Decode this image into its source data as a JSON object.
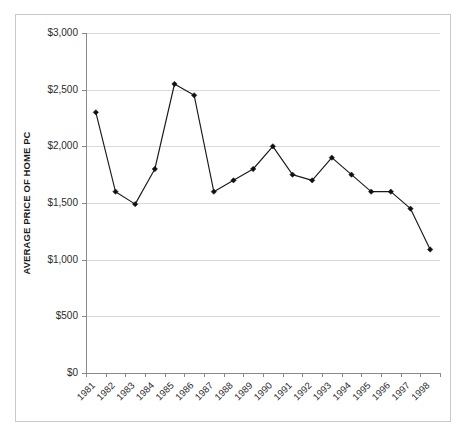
{
  "chart_data": {
    "type": "line",
    "title": "",
    "xlabel": "",
    "ylabel": "AVERAGE PRICE OF HOME PC",
    "ylim": [
      0,
      3000
    ],
    "ytick_values": [
      3000,
      2500,
      2000,
      1500,
      1000,
      500,
      0
    ],
    "ytick_labels": [
      "$3,000",
      "$2,500",
      "$2,000",
      "$1,500",
      "$1,000",
      "$500",
      "$0"
    ],
    "grid": true,
    "legend": null,
    "categories": [
      "1981",
      "1982",
      "1983",
      "1984",
      "1985",
      "1986",
      "1987",
      "1988",
      "1989",
      "1990",
      "1991",
      "1992",
      "1993",
      "1994",
      "1995",
      "1996",
      "1997",
      "1998"
    ],
    "values": [
      2300,
      1600,
      1490,
      1800,
      2550,
      2450,
      1600,
      1700,
      1800,
      2000,
      1750,
      1700,
      1900,
      1750,
      1600,
      1600,
      1450,
      1090
    ],
    "series": [
      {
        "name": "Average price of home PC",
        "marker": "diamond",
        "color": "#111111",
        "values": [
          2300,
          1600,
          1490,
          1800,
          2550,
          2450,
          1600,
          1700,
          1800,
          2000,
          1750,
          1700,
          1900,
          1750,
          1600,
          1600,
          1450,
          1090
        ]
      }
    ]
  },
  "figure": {
    "title_text": "",
    "y_axis_title": "AVERAGE PRICE OF HOME PC",
    "background_color": "#ffffff",
    "grid_color": "#d9d9d9",
    "line_color": "#111111",
    "frame_color": "#c9c9c9"
  }
}
